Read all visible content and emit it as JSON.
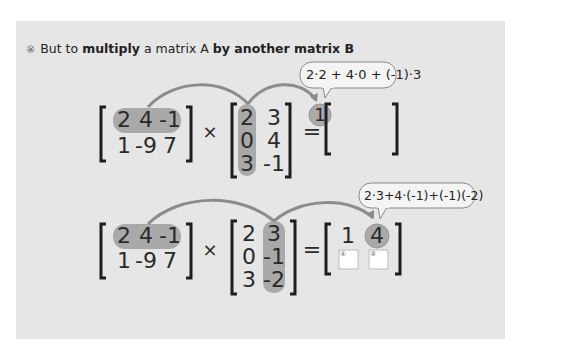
{
  "heading": {
    "mark": "※",
    "parts": [
      "But to ",
      "multiply",
      " a matrix A ",
      "by another matrix B"
    ]
  },
  "colors": {
    "panel_bg": "#e6e6e6",
    "highlight_fill": "#a9a9a9",
    "arrow": "#8c8c8c",
    "bracket": "#1e1e1e",
    "bubble_fill": "#f4f4f4",
    "bubble_stroke": "#8a8a8a"
  },
  "example1": {
    "matrix_a": [
      [
        "2",
        "4",
        "-1"
      ],
      [
        "1",
        "-9",
        "7"
      ]
    ],
    "operator": "×",
    "matrix_b": [
      [
        "2",
        "3"
      ],
      [
        "0",
        "4"
      ],
      [
        "3",
        "-1"
      ]
    ],
    "equals": "=",
    "result": [
      [
        "1",
        ""
      ]
    ],
    "bubble": "2·2 + 4·0 + (-1)·3"
  },
  "example2": {
    "matrix_a": [
      [
        "2",
        "4",
        "-1"
      ],
      [
        "1",
        "-9",
        "7"
      ]
    ],
    "operator": "×",
    "matrix_b": [
      [
        "2",
        "3"
      ],
      [
        "0",
        "-1"
      ],
      [
        "3",
        "-2"
      ]
    ],
    "equals": "=",
    "result": [
      [
        "1",
        "4"
      ]
    ],
    "bubble": "2·3+4·(-1)+(-1)(-2)",
    "answer_boxes": [
      {
        "label": "①"
      },
      {
        "label": "②"
      }
    ]
  }
}
